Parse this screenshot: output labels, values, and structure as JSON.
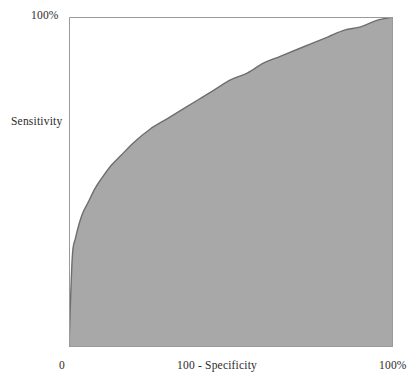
{
  "chart_data": {
    "type": "line",
    "title": "",
    "subtitle": "",
    "xlabel": "100 - Specificity",
    "ylabel": "Sensitivity",
    "xlim": [
      0,
      100
    ],
    "ylim": [
      0,
      100
    ],
    "grid": false,
    "legend": null,
    "fill": "under-curve",
    "fill_color": "#a8a8a8",
    "line_color": "#6e6e6e",
    "frame_color": "#9a9a9a",
    "x_tick_labels": [
      "0",
      "100%"
    ],
    "y_tick_labels": [
      "100%"
    ],
    "series": [
      {
        "name": "ROC curve",
        "curve_form": "y = x^0.28",
        "x": [
          0,
          1,
          2,
          4,
          6,
          8,
          10,
          13,
          16,
          20,
          25,
          30,
          35,
          40,
          45,
          50,
          55,
          60,
          65,
          70,
          75,
          80,
          85,
          90,
          95,
          100
        ],
        "y": [
          0,
          27,
          33,
          40,
          44,
          48,
          51,
          55,
          58,
          62,
          66,
          69,
          72,
          75,
          78,
          81,
          83,
          86,
          88,
          90,
          92,
          94,
          96,
          97,
          99,
          100
        ]
      }
    ],
    "annotations": []
  },
  "axis_labels": {
    "y_top": "100%",
    "y_name": "Sensitivity",
    "x_left": "0",
    "x_name": "100 - Specificity",
    "x_right": "100%"
  }
}
